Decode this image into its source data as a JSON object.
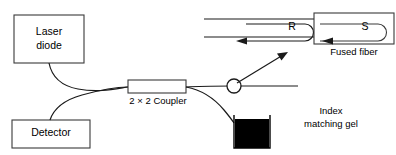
{
  "diagram": {
    "background_color": "#ffffff",
    "line_color": "#1a1a1a",
    "box_stroke_color": "#3a3a3a",
    "gel_fill_color": "#000000"
  },
  "blocks": {
    "laser_diode": {
      "label_line1": "Laser",
      "label_line2": "diode"
    },
    "detector": {
      "label": "Detector"
    },
    "coupler": {
      "label": "2 × 2 Coupler"
    },
    "fused_fiber": {
      "label": "Fused fiber"
    },
    "index_gel": {
      "label_line1": "Index",
      "label_line2": "matching gel"
    }
  },
  "annotations": {
    "reference_arm": "R",
    "sample_arm": "S"
  },
  "icons": {
    "connector": "fiber-connector-icon",
    "pointer": "diagonal-arrow-icon",
    "reference_arrow": "u-turn-arrow-icon",
    "sample_arrow": "u-turn-arrow-icon"
  }
}
